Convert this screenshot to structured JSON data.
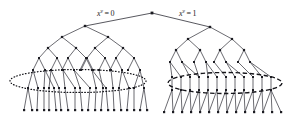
{
  "figure": {
    "type": "binary-tree-diagram",
    "background_color": "#ffffff",
    "ink_color": "#1c1c22",
    "edge_color": "#3a3a42",
    "width": 294,
    "height": 120
  },
  "labels": {
    "left_branch": {
      "variable": "x",
      "superscript": "v",
      "equals": "=",
      "value": "0",
      "full_text": "x^v = 0"
    },
    "right_branch": {
      "variable": "x",
      "superscript": "v",
      "equals": "=",
      "value": "1",
      "full_text": "x^v = 1"
    }
  },
  "annotations": {
    "left_ellipse": {
      "style": "dotted",
      "cx": 78,
      "cy": 81,
      "rx": 68,
      "ry": 11.5
    },
    "right_ellipse": {
      "style": "dashed",
      "cx": 225,
      "cy": 83,
      "rx": 57,
      "ry": 10.5
    }
  },
  "structure": {
    "root": {
      "x": 152,
      "y": 13
    },
    "left_subtree_label_position": {
      "x": 97,
      "y": 16
    },
    "right_subtree_label_position": {
      "x": 179,
      "y": 16
    },
    "left_leaf_count": 22,
    "right_leaf_count": 24
  },
  "nodes": {
    "root": [
      [
        152,
        13
      ]
    ],
    "left_level1": [
      [
        85,
        26
      ]
    ],
    "left_level2": [
      [
        62,
        37
      ],
      [
        108,
        37
      ]
    ],
    "left_level3": [
      [
        48,
        48
      ],
      [
        76,
        48
      ],
      [
        95,
        48
      ],
      [
        123,
        48
      ]
    ],
    "left_level4": [
      [
        39,
        58
      ],
      [
        57,
        58
      ],
      [
        68,
        58
      ],
      [
        86,
        58
      ],
      [
        87,
        58
      ],
      [
        105,
        58
      ],
      [
        116,
        58
      ],
      [
        134,
        58
      ]
    ],
    "left_level5": [
      [
        33,
        70
      ],
      [
        45,
        70
      ],
      [
        51,
        70
      ],
      [
        63,
        70
      ],
      [
        62,
        70
      ],
      [
        74,
        70
      ],
      [
        80,
        70
      ],
      [
        92,
        70
      ],
      [
        81,
        70
      ],
      [
        93,
        70
      ],
      [
        99,
        70
      ],
      [
        111,
        70
      ],
      [
        110,
        70
      ],
      [
        122,
        70
      ],
      [
        128,
        70
      ],
      [
        140,
        70
      ]
    ],
    "left_level6": [
      [
        28,
        88
      ],
      [
        38,
        88
      ],
      [
        44,
        88
      ],
      [
        54,
        88
      ],
      [
        49,
        88
      ],
      [
        59,
        88
      ],
      [
        65,
        88
      ],
      [
        75,
        88
      ],
      [
        80,
        88
      ],
      [
        90,
        88
      ],
      [
        96,
        88
      ],
      [
        106,
        88
      ],
      [
        103,
        88
      ],
      [
        113,
        88
      ],
      [
        119,
        88
      ],
      [
        129,
        88
      ],
      [
        134,
        88
      ],
      [
        144,
        88
      ]
    ],
    "left_leaves": [
      [
        24,
        110
      ],
      [
        32,
        110
      ],
      [
        37,
        110
      ],
      [
        44,
        110
      ],
      [
        49,
        110
      ],
      [
        56,
        110
      ],
      [
        61,
        110
      ],
      [
        68,
        110
      ],
      [
        75,
        110
      ],
      [
        82,
        110
      ],
      [
        88,
        110
      ],
      [
        95,
        110
      ],
      [
        101,
        110
      ],
      [
        108,
        110
      ],
      [
        114,
        110
      ],
      [
        121,
        110
      ],
      [
        127,
        110
      ],
      [
        134,
        110
      ],
      [
        140,
        110
      ],
      [
        147,
        110
      ]
    ],
    "right_level1": [
      [
        210,
        27
      ]
    ],
    "right_level2": [
      [
        188,
        39
      ],
      [
        232,
        39
      ]
    ],
    "right_level3": [
      [
        176,
        50
      ],
      [
        200,
        50
      ],
      [
        220,
        50
      ],
      [
        244,
        50
      ]
    ],
    "right_level4": [
      [
        170,
        62
      ],
      [
        182,
        62
      ],
      [
        194,
        62
      ],
      [
        206,
        62
      ],
      [
        214,
        62
      ],
      [
        226,
        62
      ],
      [
        238,
        62
      ],
      [
        250,
        62
      ]
    ],
    "right_level5": [
      [
        172,
        77
      ],
      [
        181,
        77
      ],
      [
        190,
        77
      ],
      [
        199,
        77
      ],
      [
        208,
        77
      ],
      [
        217,
        77
      ],
      [
        226,
        77
      ],
      [
        235,
        77
      ],
      [
        244,
        77
      ],
      [
        253,
        77
      ],
      [
        262,
        77
      ],
      [
        271,
        77
      ]
    ],
    "right_level6": [
      [
        172,
        90
      ],
      [
        181,
        90
      ],
      [
        190,
        90
      ],
      [
        199,
        90
      ],
      [
        208,
        90
      ],
      [
        217,
        90
      ],
      [
        226,
        90
      ],
      [
        235,
        90
      ],
      [
        244,
        90
      ],
      [
        253,
        90
      ],
      [
        262,
        90
      ],
      [
        271,
        90
      ]
    ],
    "right_leaves": [
      [
        164,
        112
      ],
      [
        173,
        112
      ],
      [
        182,
        112
      ],
      [
        191,
        112
      ],
      [
        200,
        112
      ],
      [
        209,
        112
      ],
      [
        218,
        112
      ],
      [
        227,
        112
      ],
      [
        236,
        112
      ],
      [
        245,
        112
      ],
      [
        254,
        112
      ],
      [
        263,
        112
      ],
      [
        272,
        112
      ],
      [
        281,
        112
      ]
    ]
  }
}
